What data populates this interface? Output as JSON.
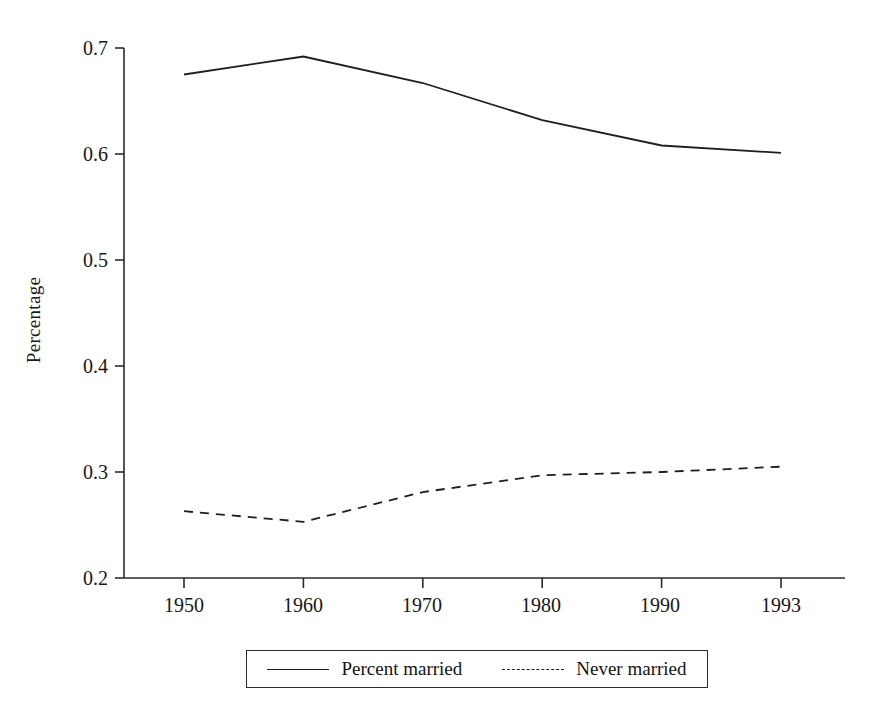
{
  "chart_data": {
    "type": "line",
    "title": "",
    "xlabel": "",
    "ylabel": "Percentage",
    "categories": [
      "1950",
      "1960",
      "1970",
      "1980",
      "1990",
      "1993"
    ],
    "x_tick_labels": [
      "1950",
      "1960",
      "1970",
      "1980",
      "1990",
      "1993"
    ],
    "y_tick_labels": [
      "0.2",
      "0.3",
      "0.4",
      "0.5",
      "0.6",
      "0.7"
    ],
    "y_ticks": [
      0.2,
      0.3,
      0.4,
      0.5,
      0.6,
      0.7
    ],
    "ylim": [
      0.2,
      0.7
    ],
    "grid": false,
    "legend_position": "bottom-center",
    "series": [
      {
        "name": "Percent married",
        "style": "solid",
        "color": "#1f1f1f",
        "values": [
          0.675,
          0.692,
          0.667,
          0.632,
          0.608,
          0.601
        ]
      },
      {
        "name": "Never married",
        "style": "dashed",
        "color": "#1f1f1f",
        "values": [
          0.263,
          0.253,
          0.281,
          0.297,
          0.3,
          0.305
        ]
      }
    ]
  },
  "legend": {
    "entries": [
      {
        "label": "Percent married",
        "style": "solid"
      },
      {
        "label": "Never married",
        "style": "dashed"
      }
    ]
  },
  "axes": {
    "y_title": "Percentage"
  }
}
